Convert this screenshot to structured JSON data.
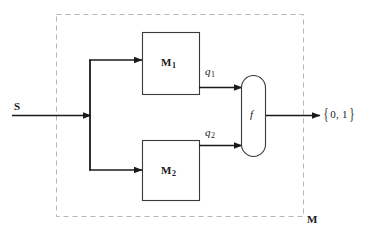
{
  "figure": {
    "type": "block-diagram",
    "title": "",
    "background_color": "#ffffff",
    "stroke_color": "#1a1a1a",
    "dashed_boundary_color": "#b0b0b0"
  },
  "labels": {
    "input_signal": "S",
    "machine_1": "M",
    "machine_1_subscript": "1",
    "machine_2": "M",
    "machine_2_subscript": "2",
    "signal_q1": "q",
    "signal_q1_subscript": "1",
    "signal_q2": "q",
    "signal_q2_subscript": "2",
    "combiner_function": "f",
    "output_brace_open": "{",
    "output_values": "0, 1",
    "output_brace_close": "}",
    "boundary_machine": "M"
  },
  "nodes": [
    {
      "id": "input",
      "name": "input-signal-s",
      "label": "S",
      "shape": "arrow",
      "x": 14,
      "y": 101
    },
    {
      "id": "m1",
      "name": "block-m1",
      "label": "M1",
      "shape": "rectangle",
      "x": 142,
      "y": 32,
      "width": 58,
      "height": 63
    },
    {
      "id": "m2",
      "name": "block-m2",
      "label": "M2",
      "shape": "rectangle",
      "x": 142,
      "y": 140,
      "width": 58,
      "height": 61
    },
    {
      "id": "f",
      "name": "block-f-combiner",
      "label": "f",
      "shape": "stadium",
      "x": 241,
      "y": 75,
      "width": 25,
      "height": 82
    },
    {
      "id": "output",
      "name": "output-set",
      "label": "{ 0, 1 }",
      "shape": "text",
      "x": 322,
      "y": 106
    },
    {
      "id": "boundary",
      "name": "machine-boundary",
      "label": "M",
      "shape": "dashed-rectangle",
      "x": 56,
      "y": 14,
      "width": 247,
      "height": 202
    }
  ],
  "edges": [
    {
      "id": "e1",
      "name": "edge-s-to-split",
      "from": "input",
      "to": "split",
      "label": ""
    },
    {
      "id": "e2",
      "name": "edge-split-to-m1",
      "from": "split",
      "to": "m1",
      "label": ""
    },
    {
      "id": "e3",
      "name": "edge-split-to-m2",
      "from": "split",
      "to": "m2",
      "label": ""
    },
    {
      "id": "e4",
      "name": "edge-m1-to-f",
      "from": "m1",
      "to": "f",
      "label": "q1"
    },
    {
      "id": "e5",
      "name": "edge-m2-to-f",
      "from": "m2",
      "to": "f",
      "label": "q2"
    },
    {
      "id": "e6",
      "name": "edge-f-to-output",
      "from": "f",
      "to": "output",
      "label": ""
    }
  ]
}
